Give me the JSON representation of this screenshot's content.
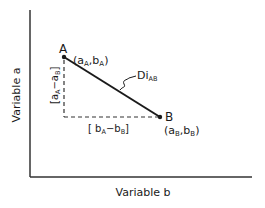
{
  "axes": {
    "y_label": "Variable a",
    "x_label": "Variable b"
  },
  "points": {
    "A": {
      "name": "A",
      "coord_open": "(a",
      "coord_sub1": "A",
      "coord_mid": ",b",
      "coord_sub2": "A",
      "coord_close": ")"
    },
    "B": {
      "name": "B",
      "coord_open": "(a",
      "coord_sub1": "B",
      "coord_mid": ",b",
      "coord_sub2": "B",
      "coord_close": ")"
    }
  },
  "distance": {
    "main": "Di",
    "sub": "AB"
  },
  "vertical_diff": {
    "open": "[a",
    "sub1": "A",
    "mid": "−a",
    "sub2": "B",
    "close": "]"
  },
  "horizontal_diff": {
    "open": "[ b",
    "sub1": "A",
    "mid": "−b",
    "sub2": "B",
    "close": "]"
  },
  "colors": {
    "ink": "#1a1a1a",
    "background": "#ffffff"
  }
}
